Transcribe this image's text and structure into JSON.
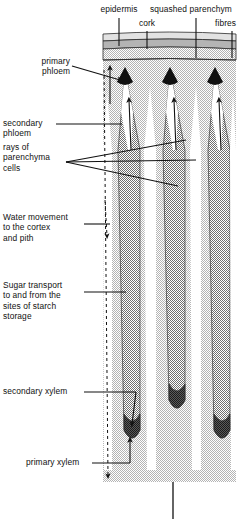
{
  "figure": {
    "colors": {
      "ink": "#111111",
      "background": "#ffffff",
      "cortex_band": "#b9b9b9",
      "cork_band": "#cfcfcf",
      "pith_background": "#d9d9d9",
      "bundle_fill": "#a6a6a6",
      "bundle_fill_dark": "#8f8f8f",
      "primary_xylem": "#4a4a4a",
      "primary_phloem": "#111111",
      "ray_white": "#ffffff"
    }
  },
  "labels": {
    "epidermis": "epidermis",
    "cork": "cork",
    "squashed_parenchyma": "squashed parenchym",
    "fibres": "fibres",
    "primary_phloem": "primary\nphloem",
    "secondary_phloem": "secondary\nphloem",
    "rays_of_parenchyma_cells": "rays of\nparenchyma\ncells",
    "water_movement": "Water movement\nto the cortex\nand pith",
    "sugar_transport": "Sugar transport\nto and from the\nsites of starch\nstorage",
    "secondary_xylem": "secondary xylem",
    "primary_xylem": "primary xylem"
  },
  "structures": {
    "bundle_count": 3,
    "layers": [
      "epidermis",
      "cork",
      "squashed parenchyma",
      "fibres"
    ],
    "arrows": {
      "water_direction": "downward",
      "water_line_style": "dashed",
      "sugar_direction": "upward",
      "sugar_line_style": "solid"
    }
  }
}
